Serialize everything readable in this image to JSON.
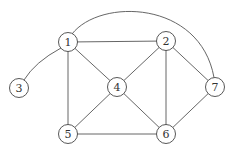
{
  "graph": {
    "nodes": [
      {
        "id": "1",
        "label": "1"
      },
      {
        "id": "2",
        "label": "2"
      },
      {
        "id": "3",
        "label": "3"
      },
      {
        "id": "4",
        "label": "4"
      },
      {
        "id": "5",
        "label": "5"
      },
      {
        "id": "6",
        "label": "6"
      },
      {
        "id": "7",
        "label": "7"
      }
    ],
    "edges": [
      {
        "from": "1",
        "to": "2",
        "style": "straight"
      },
      {
        "from": "1",
        "to": "3",
        "style": "curved"
      },
      {
        "from": "1",
        "to": "4",
        "style": "straight"
      },
      {
        "from": "1",
        "to": "5",
        "style": "straight"
      },
      {
        "from": "1",
        "to": "7",
        "style": "arc"
      },
      {
        "from": "2",
        "to": "4",
        "style": "straight"
      },
      {
        "from": "2",
        "to": "6",
        "style": "straight"
      },
      {
        "from": "2",
        "to": "7",
        "style": "straight"
      },
      {
        "from": "4",
        "to": "5",
        "style": "straight"
      },
      {
        "from": "4",
        "to": "6",
        "style": "straight"
      },
      {
        "from": "5",
        "to": "6",
        "style": "straight"
      },
      {
        "from": "6",
        "to": "7",
        "style": "straight"
      }
    ]
  }
}
